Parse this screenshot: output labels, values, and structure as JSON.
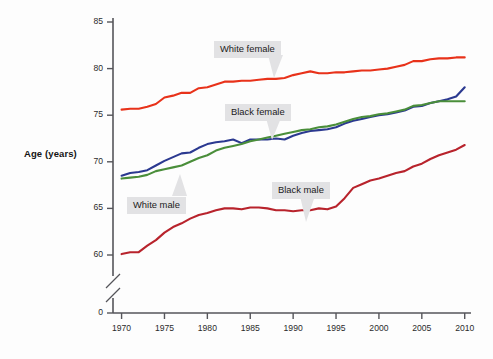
{
  "chart_data": {
    "type": "line",
    "title": "",
    "xlabel": "",
    "ylabel": "Age (years)",
    "xlim": [
      1969,
      2010.5
    ],
    "ylim": [
      58.5,
      85
    ],
    "grid": false,
    "legend_position": "inline-callouts",
    "axis_break": true,
    "axis_break_note": "y-axis broken between 0 and ~58.5",
    "yticks": [
      "85",
      "80",
      "75",
      "70",
      "65",
      "60",
      "0"
    ],
    "ytick_values": [
      85,
      80,
      75,
      70,
      65,
      60,
      0
    ],
    "xticks": [
      "1970",
      "1975",
      "1980",
      "1985",
      "1990",
      "1995",
      "2000",
      "2005",
      "2010"
    ],
    "xtick_values": [
      1970,
      1975,
      1980,
      1985,
      1990,
      1995,
      2000,
      2005,
      2010
    ],
    "x": [
      1970,
      1971,
      1972,
      1973,
      1974,
      1975,
      1976,
      1977,
      1978,
      1979,
      1980,
      1981,
      1982,
      1983,
      1984,
      1985,
      1986,
      1987,
      1988,
      1989,
      1990,
      1991,
      1992,
      1993,
      1994,
      1995,
      1996,
      1997,
      1998,
      1999,
      2000,
      2001,
      2002,
      2003,
      2004,
      2005,
      2006,
      2007,
      2008,
      2009,
      2010
    ],
    "series": [
      {
        "name": "White female",
        "color": "#e8321a",
        "values": [
          75.6,
          75.7,
          75.7,
          75.9,
          76.2,
          76.9,
          77.1,
          77.4,
          77.4,
          77.9,
          78.0,
          78.3,
          78.6,
          78.6,
          78.7,
          78.7,
          78.8,
          78.9,
          78.9,
          79.0,
          79.3,
          79.5,
          79.7,
          79.5,
          79.5,
          79.6,
          79.6,
          79.7,
          79.8,
          79.8,
          79.9,
          80.0,
          80.2,
          80.4,
          80.8,
          80.8,
          81.0,
          81.1,
          81.1,
          81.2,
          81.2
        ],
        "label_text": "White female"
      },
      {
        "name": "White male",
        "color": "#2b3990",
        "values": [
          68.5,
          68.8,
          68.9,
          69.1,
          69.6,
          70.1,
          70.5,
          70.9,
          71.0,
          71.5,
          71.9,
          72.1,
          72.2,
          72.4,
          72.0,
          72.4,
          72.4,
          72.4,
          72.5,
          72.4,
          72.8,
          73.1,
          73.3,
          73.4,
          73.5,
          73.7,
          74.1,
          74.4,
          74.6,
          74.8,
          75.0,
          75.1,
          75.3,
          75.5,
          75.9,
          76.0,
          76.3,
          76.5,
          76.7,
          77.0,
          78.0
        ],
        "label_text": "White male"
      },
      {
        "name": "Black female",
        "color": "#4a8e3a",
        "values": [
          68.2,
          68.3,
          68.4,
          68.6,
          69.0,
          69.2,
          69.4,
          69.6,
          70.0,
          70.4,
          70.7,
          71.2,
          71.5,
          71.7,
          71.9,
          72.2,
          72.4,
          72.6,
          72.8,
          73.0,
          73.2,
          73.4,
          73.5,
          73.7,
          73.8,
          74.0,
          74.3,
          74.6,
          74.8,
          74.9,
          75.1,
          75.2,
          75.4,
          75.6,
          76.0,
          76.1,
          76.3,
          76.5,
          76.5,
          76.5,
          76.5
        ],
        "label_text": "Black female"
      },
      {
        "name": "Black male",
        "color": "#b8232c",
        "values": [
          60.1,
          60.3,
          60.3,
          61.0,
          61.6,
          62.4,
          63.0,
          63.4,
          63.9,
          64.3,
          64.5,
          64.8,
          65.0,
          65.0,
          64.9,
          65.1,
          65.1,
          65.0,
          64.8,
          64.8,
          64.7,
          64.8,
          64.8,
          65.0,
          64.9,
          65.2,
          66.1,
          67.2,
          67.6,
          68.0,
          68.2,
          68.5,
          68.8,
          69.0,
          69.5,
          69.8,
          70.3,
          70.7,
          71.0,
          71.3,
          71.8
        ],
        "label_text": "Black male"
      }
    ]
  },
  "callouts": [
    {
      "id": "white-female",
      "label": "White female"
    },
    {
      "id": "black-female",
      "label": "Black female"
    },
    {
      "id": "white-male",
      "label": "White male"
    },
    {
      "id": "black-male",
      "label": "Black male"
    }
  ],
  "axis": {
    "y_title": "Age (years)"
  }
}
